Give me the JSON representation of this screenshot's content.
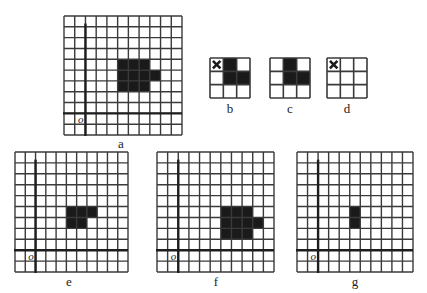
{
  "colors": {
    "grid_line": "#3a3a3a",
    "axis_line": "#1e1e1e",
    "filled_cell": "#1a1a1a",
    "background": "#ffffff"
  },
  "panels": [
    {
      "id": "a",
      "label": "a",
      "type": "grid",
      "x": 64,
      "y": 16,
      "w": 118,
      "h": 119,
      "cols": 11,
      "rows": 11,
      "axis_col": 2,
      "axis_row": 9,
      "origin_label": "o",
      "filled": [
        [
          5,
          4
        ],
        [
          6,
          4
        ],
        [
          7,
          4
        ],
        [
          5,
          5
        ],
        [
          6,
          5
        ],
        [
          7,
          5
        ],
        [
          8,
          5
        ],
        [
          5,
          6
        ],
        [
          6,
          6
        ],
        [
          7,
          6
        ]
      ],
      "crossed": [],
      "label_pos": [
        121,
        136
      ]
    },
    {
      "id": "b",
      "label": "b",
      "type": "kernel",
      "x": 210,
      "y": 58,
      "w": 40,
      "h": 40,
      "cols": 3,
      "rows": 3,
      "filled": [
        [
          1,
          0
        ],
        [
          1,
          1
        ],
        [
          2,
          1
        ]
      ],
      "crossed": [
        [
          0,
          0
        ]
      ],
      "label_pos": [
        230,
        101
      ]
    },
    {
      "id": "c",
      "label": "c",
      "type": "kernel",
      "x": 270,
      "y": 58,
      "w": 40,
      "h": 40,
      "cols": 3,
      "rows": 3,
      "filled": [
        [
          1,
          0
        ],
        [
          1,
          1
        ],
        [
          2,
          1
        ]
      ],
      "crossed": [],
      "label_pos": [
        290,
        101
      ]
    },
    {
      "id": "d",
      "label": "d",
      "type": "kernel",
      "x": 327,
      "y": 58,
      "w": 40,
      "h": 40,
      "cols": 3,
      "rows": 3,
      "filled": [],
      "crossed": [
        [
          0,
          0
        ]
      ],
      "label_pos": [
        347,
        101
      ]
    },
    {
      "id": "e",
      "label": "e",
      "type": "grid",
      "x": 15,
      "y": 152,
      "w": 113,
      "h": 120,
      "cols": 11,
      "rows": 11,
      "axis_col": 2,
      "axis_row": 9,
      "origin_label": "o",
      "filled": [
        [
          5,
          5
        ],
        [
          6,
          5
        ],
        [
          7,
          5
        ],
        [
          5,
          6
        ],
        [
          6,
          6
        ]
      ],
      "crossed": [],
      "label_pos": [
        69,
        274
      ]
    },
    {
      "id": "f",
      "label": "f",
      "type": "grid",
      "x": 157,
      "y": 152,
      "w": 117,
      "h": 120,
      "cols": 11,
      "rows": 11,
      "axis_col": 2,
      "axis_row": 9,
      "origin_label": "o",
      "filled": [
        [
          6,
          5
        ],
        [
          7,
          5
        ],
        [
          8,
          5
        ],
        [
          6,
          6
        ],
        [
          7,
          6
        ],
        [
          8,
          6
        ],
        [
          9,
          6
        ],
        [
          6,
          7
        ],
        [
          7,
          7
        ],
        [
          8,
          7
        ]
      ],
      "crossed": [],
      "label_pos": [
        216,
        274
      ]
    },
    {
      "id": "g",
      "label": "g",
      "type": "grid",
      "x": 297,
      "y": 152,
      "w": 116,
      "h": 120,
      "cols": 11,
      "rows": 11,
      "axis_col": 2,
      "axis_row": 9,
      "origin_label": "o",
      "filled": [
        [
          5,
          5
        ],
        [
          5,
          6
        ]
      ],
      "crossed": [],
      "label_pos": [
        355,
        274
      ]
    }
  ]
}
